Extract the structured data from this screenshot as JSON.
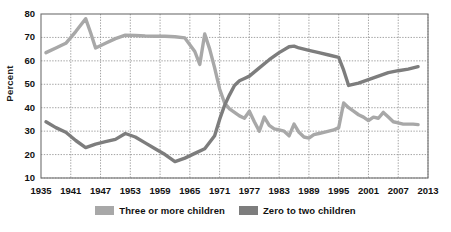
{
  "chart_data": {
    "type": "line",
    "title": "",
    "xlabel": "",
    "ylabel": "Percent",
    "xlim": [
      1935,
      2013
    ],
    "ylim": [
      10,
      80
    ],
    "yticks": [
      10,
      20,
      30,
      40,
      50,
      60,
      70,
      80
    ],
    "xticks": [
      1935,
      1941,
      1947,
      1953,
      1959,
      1965,
      1971,
      1977,
      1983,
      1989,
      1995,
      2001,
      2007,
      2013
    ],
    "grid": true,
    "legend_position": "bottom",
    "series": [
      {
        "name": "Three or more children",
        "color": "#a8a8a8",
        "x": [
          1936,
          1938,
          1940,
          1942,
          1944,
          1945,
          1946,
          1948,
          1950,
          1952,
          1954,
          1956,
          1958,
          1960,
          1962,
          1964,
          1966,
          1967,
          1968,
          1969,
          1970,
          1971,
          1972,
          1973,
          1974,
          1975,
          1976,
          1977,
          1978,
          1979,
          1980,
          1981,
          1982,
          1983,
          1984,
          1985,
          1986,
          1987,
          1988,
          1989,
          1990,
          1991,
          1992,
          1993,
          1994,
          1995,
          1996,
          1997,
          1998,
          1999,
          2000,
          2001,
          2002,
          2003,
          2004,
          2005,
          2006,
          2007,
          2008,
          2009,
          2010,
          2011
        ],
        "y": [
          63.5,
          65.5,
          67.5,
          72.5,
          78.0,
          72.0,
          65.5,
          67.5,
          69.5,
          71.0,
          70.8,
          70.6,
          70.5,
          70.5,
          70.3,
          69.8,
          64.0,
          58.5,
          71.5,
          65.0,
          57.0,
          48.0,
          42.0,
          39.5,
          38.0,
          36.5,
          35.5,
          38.5,
          34.0,
          30.0,
          36.0,
          32.5,
          31.0,
          30.5,
          30.0,
          28.0,
          33.0,
          29.5,
          27.5,
          27.0,
          28.5,
          29.0,
          29.5,
          30.0,
          30.5,
          31.5,
          42.0,
          40.0,
          38.5,
          37.0,
          36.0,
          34.5,
          36.0,
          35.5,
          38.0,
          36.0,
          34.0,
          33.5,
          33.0,
          33.0,
          33.0,
          32.8
        ]
      },
      {
        "name": "Zero to two children",
        "color": "#7d7d7d",
        "x": [
          1936,
          1938,
          1940,
          1942,
          1944,
          1946,
          1948,
          1950,
          1952,
          1954,
          1956,
          1958,
          1960,
          1962,
          1964,
          1966,
          1968,
          1970,
          1971,
          1972,
          1973,
          1974,
          1975,
          1976,
          1977,
          1979,
          1981,
          1983,
          1985,
          1986,
          1987,
          1989,
          1991,
          1993,
          1995,
          1996,
          1997,
          1999,
          2001,
          2003,
          2005,
          2007,
          2009,
          2011
        ],
        "y": [
          34.0,
          31.5,
          29.5,
          26.0,
          23.0,
          24.5,
          25.5,
          26.5,
          29.0,
          27.5,
          25.0,
          22.5,
          20.0,
          17.0,
          18.5,
          20.5,
          22.5,
          28.0,
          35.0,
          41.0,
          45.5,
          49.5,
          51.5,
          52.5,
          53.5,
          57.0,
          60.5,
          63.5,
          66.0,
          66.3,
          65.5,
          64.5,
          63.5,
          62.5,
          61.5,
          56.0,
          49.5,
          50.5,
          52.0,
          53.5,
          55.0,
          55.8,
          56.5,
          57.5
        ]
      }
    ]
  },
  "legend": [
    {
      "label": "Three or more children",
      "color": "#a8a8a8"
    },
    {
      "label": "Zero to two children",
      "color": "#7d7d7d"
    }
  ],
  "axis": {
    "y_title": "Percent"
  },
  "style": {
    "plot_border": "#6f6f6f",
    "gridline": "#8c8c8c",
    "background": "#ffffff"
  }
}
